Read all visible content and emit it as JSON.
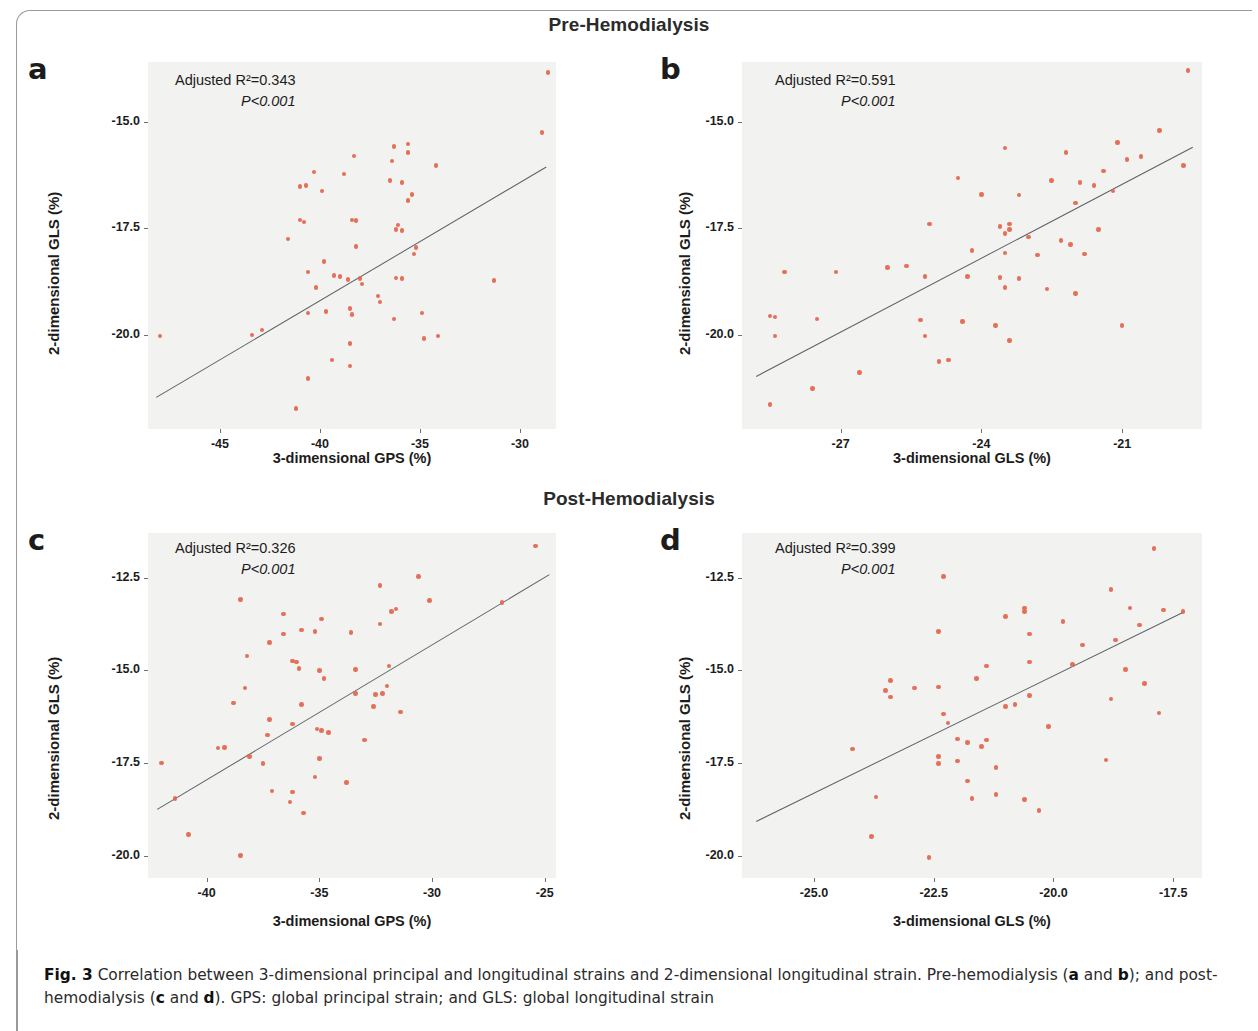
{
  "figure": {
    "section_pre": "Pre-Hemodialysis",
    "section_post": "Post-Hemodialysis",
    "caption_label": "Fig. 3",
    "caption_text": " Correlation between 3-dimensional principal and longitudinal strains and 2-dimensional longitudinal strain. Pre-hemodialysis (",
    "caption_a": "a",
    "caption_and1": " and ",
    "caption_b": "b",
    "caption_mid": "); and post-hemodialysis (",
    "caption_c": "c",
    "caption_and2": " and ",
    "caption_d": "d",
    "caption_end": "). GPS: global principal strain; and GLS: global longitudinal strain",
    "marker_color": "#e2654a",
    "fit_color": "#5b6166",
    "plot_bg": "#f2f2f1"
  },
  "chart_data": [
    {
      "id": "a",
      "panel_letter": "a",
      "type": "scatter",
      "title": "",
      "group": "Pre-Hemodialysis",
      "xlabel": "3-dimensional GPS (%)",
      "ylabel": "2-dimensional GLS (%)",
      "r2_label": "Adjusted R²=0.343",
      "p_label": "P<0.001",
      "r2": 0.343,
      "xticks": [
        -45,
        -40,
        -35,
        -30
      ],
      "xticklabels": [
        "-45",
        "-40",
        "-35",
        "-30"
      ],
      "yticks": [
        -15.0,
        -17.5,
        -20.0
      ],
      "yticklabels": [
        "-15.0",
        "-17.5",
        "-20.0"
      ],
      "xlim": [
        -48.6,
        -28.2
      ],
      "ylim": [
        -22.2,
        -13.6
      ],
      "grid": false,
      "legend": "none",
      "fit": {
        "x1": -48.2,
        "y1": -21.45,
        "x2": -28.7,
        "y2": -16.05
      },
      "points": [
        {
          "x": -28.6,
          "y": -13.85
        },
        {
          "x": -28.9,
          "y": -15.25
        },
        {
          "x": -36.3,
          "y": -15.58
        },
        {
          "x": -35.6,
          "y": -15.52
        },
        {
          "x": -35.6,
          "y": -15.72
        },
        {
          "x": -38.3,
          "y": -15.8
        },
        {
          "x": -36.4,
          "y": -15.92
        },
        {
          "x": -34.2,
          "y": -16.02
        },
        {
          "x": -40.3,
          "y": -16.18
        },
        {
          "x": -38.8,
          "y": -16.22
        },
        {
          "x": -36.5,
          "y": -16.38
        },
        {
          "x": -35.9,
          "y": -16.42
        },
        {
          "x": -40.7,
          "y": -16.5
        },
        {
          "x": -41.0,
          "y": -16.52
        },
        {
          "x": -39.9,
          "y": -16.62
        },
        {
          "x": -35.4,
          "y": -16.7
        },
        {
          "x": -35.6,
          "y": -16.85
        },
        {
          "x": -41.0,
          "y": -17.3
        },
        {
          "x": -40.8,
          "y": -17.35
        },
        {
          "x": -38.4,
          "y": -17.3
        },
        {
          "x": -38.2,
          "y": -17.32
        },
        {
          "x": -36.1,
          "y": -17.42
        },
        {
          "x": -36.2,
          "y": -17.52
        },
        {
          "x": -35.9,
          "y": -17.55
        },
        {
          "x": -41.6,
          "y": -17.75
        },
        {
          "x": -38.2,
          "y": -17.92
        },
        {
          "x": -35.2,
          "y": -17.95
        },
        {
          "x": -35.3,
          "y": -18.1
        },
        {
          "x": -39.8,
          "y": -18.28
        },
        {
          "x": -40.6,
          "y": -18.52
        },
        {
          "x": -39.3,
          "y": -18.6
        },
        {
          "x": -39.0,
          "y": -18.62
        },
        {
          "x": -38.6,
          "y": -18.7
        },
        {
          "x": -38.0,
          "y": -18.68
        },
        {
          "x": -37.9,
          "y": -18.8
        },
        {
          "x": -36.2,
          "y": -18.66
        },
        {
          "x": -35.9,
          "y": -18.68
        },
        {
          "x": -31.3,
          "y": -18.72
        },
        {
          "x": -40.2,
          "y": -18.88
        },
        {
          "x": -37.1,
          "y": -19.08
        },
        {
          "x": -37.0,
          "y": -19.22
        },
        {
          "x": -38.5,
          "y": -19.38
        },
        {
          "x": -38.4,
          "y": -19.52
        },
        {
          "x": -40.6,
          "y": -19.48
        },
        {
          "x": -39.7,
          "y": -19.45
        },
        {
          "x": -34.9,
          "y": -19.48
        },
        {
          "x": -36.3,
          "y": -19.62
        },
        {
          "x": -48.0,
          "y": -20.02
        },
        {
          "x": -43.4,
          "y": -20.0
        },
        {
          "x": -42.9,
          "y": -19.88
        },
        {
          "x": -34.1,
          "y": -20.02
        },
        {
          "x": -34.8,
          "y": -20.08
        },
        {
          "x": -38.5,
          "y": -20.2
        },
        {
          "x": -39.4,
          "y": -20.58
        },
        {
          "x": -38.5,
          "y": -20.72
        },
        {
          "x": -40.6,
          "y": -21.02
        },
        {
          "x": -41.2,
          "y": -21.72
        }
      ]
    },
    {
      "id": "b",
      "panel_letter": "b",
      "type": "scatter",
      "title": "",
      "group": "Pre-Hemodialysis",
      "xlabel": "3-dimensional GLS (%)",
      "ylabel": "2-dimensional GLS (%)",
      "r2_label": "Adjusted R²=0.591",
      "p_label": "P<0.001",
      "r2": 0.591,
      "xticks": [
        -27,
        -24,
        -21
      ],
      "xticklabels": [
        "-27",
        "-24",
        "-21"
      ],
      "yticks": [
        -15.0,
        -17.5,
        -20.0
      ],
      "yticklabels": [
        "-15.0",
        "-17.5",
        "-20.0"
      ],
      "xlim": [
        -29.1,
        -19.3
      ],
      "ylim": [
        -22.2,
        -13.6
      ],
      "grid": false,
      "legend": "none",
      "fit": {
        "x1": -28.8,
        "y1": -20.95,
        "x2": -19.5,
        "y2": -15.58
      },
      "points": [
        {
          "x": -19.6,
          "y": -13.8
        },
        {
          "x": -20.2,
          "y": -15.2
        },
        {
          "x": -21.1,
          "y": -15.48
        },
        {
          "x": -23.5,
          "y": -15.62
        },
        {
          "x": -22.2,
          "y": -15.72
        },
        {
          "x": -20.6,
          "y": -15.82
        },
        {
          "x": -20.9,
          "y": -15.88
        },
        {
          "x": -19.7,
          "y": -16.02
        },
        {
          "x": -21.4,
          "y": -16.15
        },
        {
          "x": -24.5,
          "y": -16.32
        },
        {
          "x": -22.5,
          "y": -16.38
        },
        {
          "x": -21.9,
          "y": -16.42
        },
        {
          "x": -21.6,
          "y": -16.5
        },
        {
          "x": -21.2,
          "y": -16.62
        },
        {
          "x": -24.0,
          "y": -16.7
        },
        {
          "x": -23.2,
          "y": -16.72
        },
        {
          "x": -22.0,
          "y": -16.9
        },
        {
          "x": -25.1,
          "y": -17.4
        },
        {
          "x": -23.4,
          "y": -17.4
        },
        {
          "x": -23.6,
          "y": -17.45
        },
        {
          "x": -23.4,
          "y": -17.52
        },
        {
          "x": -21.5,
          "y": -17.52
        },
        {
          "x": -23.5,
          "y": -17.62
        },
        {
          "x": -23.0,
          "y": -17.7
        },
        {
          "x": -22.3,
          "y": -17.78
        },
        {
          "x": -22.1,
          "y": -17.88
        },
        {
          "x": -24.2,
          "y": -18.02
        },
        {
          "x": -23.5,
          "y": -18.08
        },
        {
          "x": -22.8,
          "y": -18.12
        },
        {
          "x": -21.8,
          "y": -18.1
        },
        {
          "x": -25.6,
          "y": -18.38
        },
        {
          "x": -26.0,
          "y": -18.42
        },
        {
          "x": -28.2,
          "y": -18.52
        },
        {
          "x": -27.1,
          "y": -18.52
        },
        {
          "x": -25.2,
          "y": -18.62
        },
        {
          "x": -24.3,
          "y": -18.62
        },
        {
          "x": -23.6,
          "y": -18.65
        },
        {
          "x": -23.2,
          "y": -18.68
        },
        {
          "x": -23.5,
          "y": -18.88
        },
        {
          "x": -22.6,
          "y": -18.92
        },
        {
          "x": -22.0,
          "y": -19.02
        },
        {
          "x": -28.5,
          "y": -19.55
        },
        {
          "x": -28.4,
          "y": -19.58
        },
        {
          "x": -27.5,
          "y": -19.62
        },
        {
          "x": -25.3,
          "y": -19.65
        },
        {
          "x": -24.4,
          "y": -19.68
        },
        {
          "x": -23.7,
          "y": -19.78
        },
        {
          "x": -21.0,
          "y": -19.78
        },
        {
          "x": -28.4,
          "y": -20.02
        },
        {
          "x": -25.2,
          "y": -20.02
        },
        {
          "x": -23.4,
          "y": -20.12
        },
        {
          "x": -24.9,
          "y": -20.62
        },
        {
          "x": -24.7,
          "y": -20.58
        },
        {
          "x": -26.6,
          "y": -20.88
        },
        {
          "x": -27.6,
          "y": -21.25
        },
        {
          "x": -28.5,
          "y": -21.62
        }
      ]
    },
    {
      "id": "c",
      "panel_letter": "c",
      "type": "scatter",
      "title": "",
      "group": "Post-Hemodialysis",
      "xlabel": "3-dimensional GPS (%)",
      "ylabel": "2-dimensional GLS (%)",
      "r2_label": "Adjusted R²=0.326",
      "p_label": "P<0.001",
      "r2": 0.326,
      "xticks": [
        -40,
        -35,
        -30,
        -25
      ],
      "xticklabels": [
        "-40",
        "-35",
        "-30",
        "-25"
      ],
      "yticks": [
        -12.5,
        -15.0,
        -17.5,
        -20.0
      ],
      "yticklabels": [
        "-12.5",
        "-15.0",
        "-17.5",
        "-20.0"
      ],
      "xlim": [
        -42.6,
        -24.5
      ],
      "ylim": [
        -20.6,
        -11.3
      ],
      "grid": false,
      "legend": "none",
      "fit": {
        "x1": -42.2,
        "y1": -18.75,
        "x2": -24.8,
        "y2": -12.42
      },
      "points": [
        {
          "x": -25.4,
          "y": -11.65
        },
        {
          "x": -30.6,
          "y": -12.48
        },
        {
          "x": -32.3,
          "y": -12.72
        },
        {
          "x": -38.5,
          "y": -13.1
        },
        {
          "x": -30.1,
          "y": -13.12
        },
        {
          "x": -26.9,
          "y": -13.18
        },
        {
          "x": -31.6,
          "y": -13.35
        },
        {
          "x": -31.8,
          "y": -13.42
        },
        {
          "x": -36.6,
          "y": -13.48
        },
        {
          "x": -34.9,
          "y": -13.62
        },
        {
          "x": -32.3,
          "y": -13.75
        },
        {
          "x": -35.8,
          "y": -13.92
        },
        {
          "x": -35.2,
          "y": -13.95
        },
        {
          "x": -36.6,
          "y": -14.02
        },
        {
          "x": -33.6,
          "y": -13.98
        },
        {
          "x": -37.2,
          "y": -14.25
        },
        {
          "x": -38.2,
          "y": -14.62
        },
        {
          "x": -36.2,
          "y": -14.75
        },
        {
          "x": -36.0,
          "y": -14.78
        },
        {
          "x": -35.9,
          "y": -14.95
        },
        {
          "x": -35.0,
          "y": -15.0
        },
        {
          "x": -33.4,
          "y": -14.98
        },
        {
          "x": -31.9,
          "y": -14.88
        },
        {
          "x": -34.8,
          "y": -15.22
        },
        {
          "x": -38.3,
          "y": -15.48
        },
        {
          "x": -32.0,
          "y": -15.42
        },
        {
          "x": -33.4,
          "y": -15.62
        },
        {
          "x": -32.5,
          "y": -15.65
        },
        {
          "x": -32.2,
          "y": -15.62
        },
        {
          "x": -38.8,
          "y": -15.88
        },
        {
          "x": -35.8,
          "y": -15.92
        },
        {
          "x": -32.6,
          "y": -15.98
        },
        {
          "x": -31.4,
          "y": -16.12
        },
        {
          "x": -37.2,
          "y": -16.32
        },
        {
          "x": -36.2,
          "y": -16.45
        },
        {
          "x": -35.1,
          "y": -16.58
        },
        {
          "x": -34.9,
          "y": -16.62
        },
        {
          "x": -34.6,
          "y": -16.68
        },
        {
          "x": -37.3,
          "y": -16.75
        },
        {
          "x": -33.0,
          "y": -16.88
        },
        {
          "x": -39.5,
          "y": -17.1
        },
        {
          "x": -39.2,
          "y": -17.08
        },
        {
          "x": -38.1,
          "y": -17.32
        },
        {
          "x": -35.0,
          "y": -17.38
        },
        {
          "x": -37.5,
          "y": -17.52
        },
        {
          "x": -42.0,
          "y": -17.5
        },
        {
          "x": -35.2,
          "y": -17.88
        },
        {
          "x": -33.8,
          "y": -18.02
        },
        {
          "x": -37.1,
          "y": -18.25
        },
        {
          "x": -36.2,
          "y": -18.28
        },
        {
          "x": -41.4,
          "y": -18.45
        },
        {
          "x": -36.3,
          "y": -18.55
        },
        {
          "x": -35.7,
          "y": -18.85
        },
        {
          "x": -40.8,
          "y": -19.42
        },
        {
          "x": -38.5,
          "y": -20.0
        }
      ]
    },
    {
      "id": "d",
      "panel_letter": "d",
      "type": "scatter",
      "title": "",
      "group": "Post-Hemodialysis",
      "xlabel": "3-dimensional GLS (%)",
      "ylabel": "2-dimensional GLS (%)",
      "r2_label": "Adjusted R²=0.399",
      "p_label": "P<0.001",
      "r2": 0.399,
      "xticks": [
        -25.0,
        -22.5,
        -20.0,
        -17.5
      ],
      "xticklabels": [
        "-25.0",
        "-22.5",
        "-20.0",
        "-17.5"
      ],
      "yticks": [
        -12.5,
        -15.0,
        -17.5,
        -20.0
      ],
      "yticklabels": [
        "-12.5",
        "-15.0",
        "-17.5",
        "-20.0"
      ],
      "xlim": [
        -26.5,
        -16.9
      ],
      "ylim": [
        -20.6,
        -11.3
      ],
      "grid": false,
      "legend": "none",
      "fit": {
        "x1": -26.2,
        "y1": -19.05,
        "x2": -17.3,
        "y2": -13.42
      },
      "points": [
        {
          "x": -17.9,
          "y": -11.72
        },
        {
          "x": -22.3,
          "y": -12.48
        },
        {
          "x": -18.8,
          "y": -12.82
        },
        {
          "x": -20.6,
          "y": -13.32
        },
        {
          "x": -18.4,
          "y": -13.32
        },
        {
          "x": -17.7,
          "y": -13.38
        },
        {
          "x": -20.6,
          "y": -13.42
        },
        {
          "x": -17.3,
          "y": -13.42
        },
        {
          "x": -21.0,
          "y": -13.55
        },
        {
          "x": -19.8,
          "y": -13.68
        },
        {
          "x": -18.2,
          "y": -13.78
        },
        {
          "x": -22.4,
          "y": -13.95
        },
        {
          "x": -20.5,
          "y": -14.02
        },
        {
          "x": -18.7,
          "y": -14.18
        },
        {
          "x": -19.4,
          "y": -14.32
        },
        {
          "x": -20.5,
          "y": -14.78
        },
        {
          "x": -19.6,
          "y": -14.85
        },
        {
          "x": -21.4,
          "y": -14.88
        },
        {
          "x": -18.5,
          "y": -14.98
        },
        {
          "x": -23.4,
          "y": -15.28
        },
        {
          "x": -21.6,
          "y": -15.22
        },
        {
          "x": -18.1,
          "y": -15.35
        },
        {
          "x": -23.5,
          "y": -15.55
        },
        {
          "x": -22.9,
          "y": -15.48
        },
        {
          "x": -22.4,
          "y": -15.45
        },
        {
          "x": -20.5,
          "y": -15.68
        },
        {
          "x": -23.4,
          "y": -15.72
        },
        {
          "x": -18.8,
          "y": -15.78
        },
        {
          "x": -20.8,
          "y": -15.92
        },
        {
          "x": -21.0,
          "y": -15.98
        },
        {
          "x": -17.8,
          "y": -16.15
        },
        {
          "x": -22.3,
          "y": -16.18
        },
        {
          "x": -22.2,
          "y": -16.42
        },
        {
          "x": -20.1,
          "y": -16.52
        },
        {
          "x": -22.0,
          "y": -16.85
        },
        {
          "x": -21.4,
          "y": -16.88
        },
        {
          "x": -21.8,
          "y": -16.95
        },
        {
          "x": -21.5,
          "y": -17.05
        },
        {
          "x": -24.2,
          "y": -17.12
        },
        {
          "x": -22.4,
          "y": -17.32
        },
        {
          "x": -22.0,
          "y": -17.45
        },
        {
          "x": -22.4,
          "y": -17.52
        },
        {
          "x": -21.2,
          "y": -17.62
        },
        {
          "x": -18.9,
          "y": -17.42
        },
        {
          "x": -21.8,
          "y": -17.98
        },
        {
          "x": -21.2,
          "y": -18.35
        },
        {
          "x": -23.7,
          "y": -18.42
        },
        {
          "x": -21.7,
          "y": -18.45
        },
        {
          "x": -20.6,
          "y": -18.48
        },
        {
          "x": -20.3,
          "y": -18.78
        },
        {
          "x": -23.8,
          "y": -19.48
        },
        {
          "x": -22.6,
          "y": -20.05
        }
      ]
    }
  ]
}
